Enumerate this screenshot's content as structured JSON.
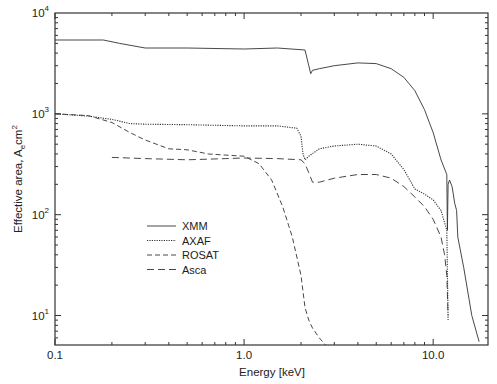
{
  "chart_data": {
    "type": "line",
    "title": "",
    "xlabel": "Energy [keV]",
    "ylabel": "Effective area, A_e cm^2",
    "xscale": "log",
    "yscale": "log",
    "xlim": [
      0.1,
      19.5
    ],
    "ylim": [
      5.1,
      10000
    ],
    "grid": false,
    "legend_position": "lower-left-center",
    "x_tick_labels": [
      "0.1",
      "1.0",
      "10.0"
    ],
    "y_tick_labels": [
      "10^1",
      "10^2",
      "10^3",
      "10^4"
    ],
    "series": [
      {
        "name": "XMM",
        "style": "solid",
        "x": [
          0.1,
          0.18,
          0.22,
          0.3,
          0.5,
          1.0,
          1.5,
          2.1,
          2.2,
          2.25,
          2.3,
          2.5,
          3.0,
          4.0,
          5.0,
          6.0,
          7.0,
          8.0,
          9.0,
          10.0,
          11.0,
          11.8,
          11.9,
          12.0,
          12.2,
          12.6,
          13.0,
          13.3,
          13.5,
          14.5,
          16.0,
          17.5
        ],
        "y": [
          5400,
          5400,
          5000,
          4500,
          4500,
          4400,
          4500,
          4300,
          3000,
          2500,
          2700,
          2800,
          3000,
          3200,
          3150,
          2800,
          2300,
          1700,
          1100,
          650,
          350,
          250,
          70,
          200,
          220,
          190,
          130,
          110,
          60,
          30,
          10,
          5.5
        ]
      },
      {
        "name": "AXAF",
        "style": "dotted",
        "x": [
          0.1,
          0.15,
          0.2,
          0.25,
          0.3,
          0.5,
          1.0,
          1.5,
          1.9,
          2.0,
          2.05,
          2.1,
          2.2,
          2.5,
          3.0,
          4.0,
          5.0,
          6.0,
          7.0,
          8.0,
          9.0,
          10.0,
          11.0,
          11.8,
          12.0
        ],
        "y": [
          1000,
          950,
          880,
          800,
          790,
          780,
          760,
          760,
          720,
          600,
          400,
          350,
          380,
          450,
          480,
          500,
          480,
          400,
          280,
          180,
          160,
          140,
          110,
          70,
          9
        ]
      },
      {
        "name": "ROSAT",
        "style": "dashed",
        "x": [
          0.1,
          0.15,
          0.2,
          0.25,
          0.3,
          0.4,
          0.5,
          0.65,
          0.8,
          1.0,
          1.2,
          1.4,
          1.6,
          1.8,
          2.0,
          2.1,
          2.2,
          2.3,
          2.5,
          2.7
        ],
        "y": [
          1000,
          960,
          820,
          650,
          550,
          450,
          440,
          400,
          390,
          380,
          320,
          220,
          120,
          60,
          25,
          12,
          9,
          7.5,
          6,
          5.1
        ]
      },
      {
        "name": "Asca",
        "style": "long-dash",
        "x": [
          0.2,
          0.3,
          0.5,
          0.8,
          1.0,
          1.5,
          2.0,
          2.1,
          2.2,
          2.3,
          2.5,
          3.0,
          4.0,
          5.0,
          6.0,
          7.0,
          8.0,
          9.0,
          10.0,
          11.0,
          11.5,
          11.8,
          12.0
        ],
        "y": [
          370,
          360,
          350,
          360,
          365,
          360,
          350,
          320,
          260,
          210,
          210,
          230,
          250,
          250,
          230,
          190,
          150,
          120,
          90,
          60,
          40,
          25,
          10
        ]
      }
    ]
  },
  "legend": {
    "items": [
      {
        "label": "XMM",
        "style": "solid"
      },
      {
        "label": "AXAF",
        "style": "dotted"
      },
      {
        "label": "ROSAT",
        "style": "dashed"
      },
      {
        "label": "Asca",
        "style": "long-dash"
      }
    ]
  },
  "axes": {
    "xlabel": "Energy [keV]",
    "ylabel_main": "Effective area, A",
    "ylabel_sub": "e",
    "ylabel_unit": "cm",
    "ylabel_sup": "2",
    "x_ticks": [
      {
        "label": "0.1",
        "value": 0.1
      },
      {
        "label": "1.0",
        "value": 1.0
      },
      {
        "label": "10.0",
        "value": 10.0
      }
    ],
    "y_ticks": [
      {
        "base": "10",
        "exp": "1",
        "value": 10
      },
      {
        "base": "10",
        "exp": "2",
        "value": 100
      },
      {
        "base": "10",
        "exp": "3",
        "value": 1000
      },
      {
        "base": "10",
        "exp": "4",
        "value": 10000
      }
    ]
  },
  "colors": {
    "line": "#333333",
    "axis": "#333333",
    "background": "#ffffff"
  }
}
